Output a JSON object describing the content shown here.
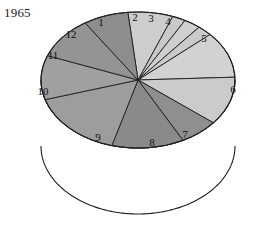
{
  "title": "1965",
  "chart_data": {
    "type": "pie",
    "title": "1965",
    "subtitle": "",
    "xlabel": "",
    "ylabel": "",
    "style": "3d-cylinder",
    "legend": "none",
    "grid": false,
    "labels_inside": true,
    "start_angle_deg": -96,
    "direction": "clockwise",
    "categories": [
      "1",
      "2",
      "3",
      "4",
      "5",
      "6",
      "7",
      "8",
      "9",
      "10",
      "11",
      "12"
    ],
    "values": [
      7.5,
      2.2,
      2.8,
      2.5,
      11.0,
      11.5,
      6.5,
      12.0,
      16.0,
      10.5,
      10.0,
      7.5
    ],
    "percent_total": 100.0,
    "colors": [
      "#cdcdcd",
      "#c9c9c9",
      "#cfcfcf",
      "#cacaca",
      "#d2d2d2",
      "#cbcbcb",
      "#8f8f8f",
      "#8a8a8a",
      "#9d9d9d",
      "#a0a0a0",
      "#949494",
      "#8d8d8d"
    ],
    "slice_labels": [
      {
        "id": "1",
        "text": "1",
        "x": 101,
        "y": 23
      },
      {
        "id": "2",
        "text": "2",
        "x": 135,
        "y": 18
      },
      {
        "id": "3",
        "text": "3",
        "x": 151,
        "y": 19
      },
      {
        "id": "4",
        "text": "4",
        "x": 168,
        "y": 22
      },
      {
        "id": "5",
        "text": "5",
        "x": 204,
        "y": 39
      },
      {
        "id": "6",
        "text": "6",
        "x": 233,
        "y": 90
      },
      {
        "id": "7",
        "text": "7",
        "x": 185,
        "y": 135
      },
      {
        "id": "8",
        "text": "8",
        "x": 152,
        "y": 143
      },
      {
        "id": "9",
        "text": "9",
        "x": 98,
        "y": 138
      },
      {
        "id": "10",
        "text": "10",
        "x": 43,
        "y": 92
      },
      {
        "id": "11",
        "text": "11",
        "x": 53,
        "y": 56
      },
      {
        "id": "12",
        "text": "12",
        "x": 71,
        "y": 35
      }
    ]
  },
  "geometry": {
    "center_x": 138,
    "center_y": 80,
    "radius_x": 97,
    "radius_y": 68,
    "depth": 66
  },
  "colors": {
    "background": "#ffffff",
    "outline": "#1d1d1d",
    "text": "#111111"
  }
}
